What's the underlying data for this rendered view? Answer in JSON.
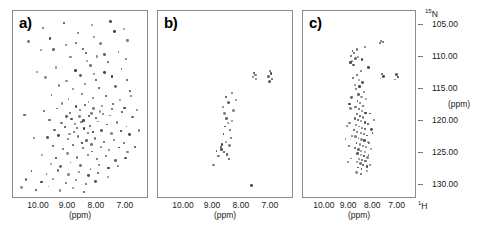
{
  "figure": {
    "panels": [
      {
        "id": "a",
        "label": "a)"
      },
      {
        "id": "b",
        "label": "b)"
      },
      {
        "id": "c",
        "label": "c)"
      }
    ],
    "x_axis": {
      "ticks": [
        "10.00",
        "9.00",
        "8.00",
        "7.00"
      ],
      "tick_values": [
        10.0,
        9.0,
        8.0,
        7.0
      ],
      "unit": "(ppm)",
      "nucleus": "1H",
      "nucleus_display": "H",
      "nucleus_superscript": "1"
    },
    "y_axis": {
      "ticks": [
        "105.00",
        "110.00",
        "115.00",
        "120.00",
        "125.00",
        "130.00"
      ],
      "tick_values": [
        105.0,
        110.0,
        115.0,
        120.0,
        125.0,
        130.0
      ],
      "unit": "(ppm)",
      "nucleus": "15N",
      "nucleus_display": "N",
      "nucleus_superscript": "15"
    },
    "colors": {
      "peak": "#3a3a3a",
      "frame": "#8c8c8c",
      "background": "#ffffff",
      "text": "#1a1a1a"
    }
  },
  "chart_data": [
    {
      "type": "scatter",
      "title": "a)",
      "xlabel": "(ppm)",
      "ylabel": "(ppm)",
      "xlim": [
        10.9,
        6.2
      ],
      "ylim": [
        103.0,
        132.0
      ],
      "grid": false,
      "legend": "none",
      "description": "2D 1H-15N HSQC spectrum, well dispersed peaks indicating a folded protein",
      "points": [
        [
          9.85,
          105.6
        ],
        [
          9.12,
          104.9
        ],
        [
          8.12,
          105.2
        ],
        [
          7.48,
          104.6
        ],
        [
          7.02,
          105.8
        ],
        [
          9.6,
          107.3
        ],
        [
          8.62,
          106.4
        ],
        [
          8.05,
          107.0
        ],
        [
          7.35,
          106.2
        ],
        [
          6.88,
          107.6
        ],
        [
          9.92,
          109.1
        ],
        [
          9.05,
          108.3
        ],
        [
          8.45,
          108.9
        ],
        [
          7.82,
          108.0
        ],
        [
          7.2,
          109.4
        ],
        [
          8.88,
          110.2
        ],
        [
          8.3,
          110.8
        ],
        [
          7.95,
          110.1
        ],
        [
          7.58,
          111.0
        ],
        [
          6.95,
          110.5
        ],
        [
          9.4,
          111.8
        ],
        [
          8.7,
          112.3
        ],
        [
          8.18,
          111.5
        ],
        [
          7.7,
          112.6
        ],
        [
          7.1,
          112.0
        ],
        [
          9.75,
          113.4
        ],
        [
          9.02,
          113.9
        ],
        [
          8.52,
          113.1
        ],
        [
          8.0,
          113.7
        ],
        [
          7.42,
          113.2
        ],
        [
          6.9,
          113.8
        ],
        [
          9.28,
          114.6
        ],
        [
          8.8,
          115.2
        ],
        [
          8.38,
          114.4
        ],
        [
          7.88,
          115.0
        ],
        [
          7.3,
          114.8
        ],
        [
          6.8,
          115.5
        ],
        [
          9.55,
          116.1
        ],
        [
          8.95,
          116.7
        ],
        [
          8.48,
          116.0
        ],
        [
          8.08,
          116.5
        ],
        [
          7.62,
          116.2
        ],
        [
          7.15,
          116.9
        ],
        [
          6.75,
          116.3
        ],
        [
          9.18,
          117.4
        ],
        [
          8.68,
          117.9
        ],
        [
          8.25,
          117.2
        ],
        [
          7.78,
          117.8
        ],
        [
          7.38,
          117.5
        ],
        [
          6.98,
          118.1
        ],
        [
          9.8,
          118.6
        ],
        [
          9.35,
          118.2
        ],
        [
          8.9,
          118.9
        ],
        [
          8.55,
          118.4
        ],
        [
          8.15,
          119.0
        ],
        [
          7.85,
          118.7
        ],
        [
          7.5,
          119.3
        ],
        [
          7.08,
          118.8
        ],
        [
          6.7,
          119.5
        ],
        [
          9.62,
          120.0
        ],
        [
          9.2,
          120.5
        ],
        [
          8.85,
          119.8
        ],
        [
          8.5,
          120.3
        ],
        [
          8.2,
          120.9
        ],
        [
          7.92,
          120.2
        ],
        [
          7.6,
          120.7
        ],
        [
          7.25,
          120.4
        ],
        [
          6.92,
          121.0
        ],
        [
          9.45,
          121.5
        ],
        [
          9.08,
          121.1
        ],
        [
          8.75,
          121.8
        ],
        [
          8.42,
          121.3
        ],
        [
          8.1,
          121.9
        ],
        [
          7.8,
          121.6
        ],
        [
          7.45,
          122.1
        ],
        [
          7.12,
          121.7
        ],
        [
          6.82,
          122.3
        ],
        [
          9.7,
          122.7
        ],
        [
          9.3,
          122.4
        ],
        [
          8.98,
          123.0
        ],
        [
          8.62,
          122.6
        ],
        [
          8.32,
          123.2
        ],
        [
          8.02,
          122.9
        ],
        [
          7.72,
          123.4
        ],
        [
          7.35,
          123.1
        ],
        [
          7.0,
          123.6
        ],
        [
          9.5,
          124.0
        ],
        [
          9.15,
          124.5
        ],
        [
          8.8,
          123.9
        ],
        [
          8.45,
          124.4
        ],
        [
          8.12,
          124.9
        ],
        [
          7.82,
          124.2
        ],
        [
          7.52,
          124.7
        ],
        [
          7.18,
          124.3
        ],
        [
          6.88,
          125.0
        ],
        [
          9.88,
          125.4
        ],
        [
          9.38,
          125.9
        ],
        [
          9.0,
          125.2
        ],
        [
          8.65,
          125.8
        ],
        [
          8.28,
          125.5
        ],
        [
          7.95,
          126.1
        ],
        [
          7.65,
          125.6
        ],
        [
          7.3,
          126.3
        ],
        [
          6.95,
          125.9
        ],
        [
          9.58,
          126.8
        ],
        [
          9.22,
          127.2
        ],
        [
          8.88,
          126.6
        ],
        [
          8.52,
          127.1
        ],
        [
          8.18,
          127.6
        ],
        [
          7.88,
          127.0
        ],
        [
          7.55,
          127.5
        ],
        [
          7.22,
          127.2
        ],
        [
          10.25,
          128.0
        ],
        [
          9.72,
          128.4
        ],
        [
          9.32,
          127.9
        ],
        [
          8.95,
          128.5
        ],
        [
          8.58,
          128.1
        ],
        [
          8.25,
          128.7
        ],
        [
          7.92,
          128.3
        ],
        [
          7.58,
          128.8
        ],
        [
          10.45,
          129.3
        ],
        [
          9.9,
          129.7
        ],
        [
          9.48,
          129.2
        ],
        [
          9.05,
          129.8
        ],
        [
          8.68,
          129.4
        ],
        [
          8.35,
          130.0
        ],
        [
          8.0,
          129.6
        ],
        [
          10.6,
          130.5
        ],
        [
          10.1,
          130.9
        ],
        [
          9.65,
          130.4
        ],
        [
          9.25,
          131.0
        ],
        [
          8.8,
          130.6
        ],
        [
          8.42,
          131.2
        ],
        [
          10.35,
          107.8
        ],
        [
          10.05,
          112.5
        ],
        [
          10.5,
          119.2
        ],
        [
          10.15,
          122.8
        ],
        [
          6.55,
          118.4
        ],
        [
          6.48,
          121.6
        ],
        [
          6.62,
          124.2
        ],
        [
          8.35,
          109.5
        ],
        [
          8.7,
          108.0
        ],
        [
          7.68,
          109.8
        ],
        [
          9.48,
          109.0
        ],
        [
          8.05,
          112.8
        ],
        [
          8.58,
          119.5
        ],
        [
          8.22,
          119.3
        ],
        [
          7.98,
          119.7
        ],
        [
          8.42,
          120.1
        ],
        [
          8.72,
          120.6
        ],
        [
          8.08,
          118.2
        ],
        [
          8.38,
          117.6
        ],
        [
          8.65,
          121.2
        ],
        [
          8.28,
          122.0
        ],
        [
          7.75,
          119.1
        ],
        [
          7.42,
          118.3
        ],
        [
          9.02,
          119.4
        ],
        [
          8.92,
          122.2
        ],
        [
          8.48,
          123.6
        ],
        [
          8.15,
          123.8
        ]
      ]
    },
    {
      "type": "scatter",
      "title": "b)",
      "xlabel": "(ppm)",
      "ylabel": "(ppm)",
      "xlim": [
        10.9,
        6.2
      ],
      "ylim": [
        103.0,
        132.0
      ],
      "grid": false,
      "legend": "none",
      "description": "2D 1H-15N HSQC spectrum, very few poorly dispersed peaks indicating an unfolded or aggregated sample",
      "points": [
        [
          7.52,
          112.6
        ],
        [
          7.48,
          113.0
        ],
        [
          7.56,
          113.3
        ],
        [
          7.45,
          113.6
        ],
        [
          6.98,
          112.4
        ],
        [
          6.94,
          112.8
        ],
        [
          7.02,
          113.2
        ],
        [
          6.9,
          113.6
        ],
        [
          6.98,
          114.0
        ],
        [
          8.3,
          115.8
        ],
        [
          8.52,
          116.4
        ],
        [
          8.42,
          117.2
        ],
        [
          8.62,
          118.0
        ],
        [
          8.58,
          119.0
        ],
        [
          8.5,
          119.8
        ],
        [
          8.45,
          120.5
        ],
        [
          8.55,
          121.0
        ],
        [
          8.38,
          121.6
        ],
        [
          8.6,
          122.2
        ],
        [
          8.35,
          122.8
        ],
        [
          8.52,
          123.4
        ],
        [
          8.65,
          123.8
        ],
        [
          8.7,
          124.2
        ],
        [
          8.68,
          124.6
        ],
        [
          8.58,
          125.0
        ],
        [
          8.48,
          125.4
        ],
        [
          8.85,
          124.8
        ],
        [
          8.78,
          125.6
        ],
        [
          8.42,
          126.0
        ],
        [
          8.95,
          127.0
        ],
        [
          7.62,
          130.2
        ],
        [
          8.18,
          116.8
        ],
        [
          8.25,
          118.5
        ],
        [
          8.32,
          120.2
        ],
        [
          8.4,
          124.0
        ]
      ]
    },
    {
      "type": "scatter",
      "title": "c)",
      "xlabel": "(ppm)",
      "ylabel": "(ppm)",
      "xlim": [
        10.9,
        6.2
      ],
      "ylim": [
        103.0,
        132.0
      ],
      "grid": false,
      "legend": "none",
      "description": "2D 1H-15N HSQC spectrum with crowded central cluster near 8.0-8.7 ppm plus sidechain pairs, indicating a partially disordered protein",
      "points": [
        [
          7.62,
          107.6
        ],
        [
          7.55,
          107.8
        ],
        [
          7.68,
          108.0
        ],
        [
          8.82,
          109.2
        ],
        [
          8.75,
          109.6
        ],
        [
          8.88,
          110.0
        ],
        [
          8.7,
          110.4
        ],
        [
          8.85,
          110.8
        ],
        [
          8.65,
          109.0
        ],
        [
          8.92,
          111.0
        ],
        [
          8.58,
          110.2
        ],
        [
          8.78,
          111.4
        ],
        [
          8.3,
          108.6
        ],
        [
          8.42,
          110.6
        ],
        [
          8.15,
          111.8
        ],
        [
          7.58,
          112.8
        ],
        [
          7.52,
          113.2
        ],
        [
          7.64,
          113.5
        ],
        [
          6.98,
          112.9
        ],
        [
          6.92,
          113.3
        ],
        [
          7.04,
          113.7
        ],
        [
          8.48,
          112.4
        ],
        [
          8.62,
          113.0
        ],
        [
          8.55,
          113.8
        ],
        [
          8.4,
          114.2
        ],
        [
          8.52,
          114.8
        ],
        [
          8.68,
          115.2
        ],
        [
          8.35,
          115.6
        ],
        [
          8.58,
          116.0
        ],
        [
          8.45,
          116.4
        ],
        [
          8.25,
          116.8
        ],
        [
          8.62,
          117.0
        ],
        [
          8.5,
          117.4
        ],
        [
          8.38,
          117.8
        ],
        [
          8.7,
          118.0
        ],
        [
          8.55,
          118.3
        ],
        [
          8.42,
          118.6
        ],
        [
          8.28,
          118.9
        ],
        [
          8.65,
          119.1
        ],
        [
          8.52,
          119.4
        ],
        [
          8.38,
          119.6
        ],
        [
          8.72,
          119.8
        ],
        [
          8.6,
          120.0
        ],
        [
          8.45,
          120.2
        ],
        [
          8.3,
          120.4
        ],
        [
          8.18,
          120.6
        ],
        [
          8.68,
          120.8
        ],
        [
          8.55,
          121.0
        ],
        [
          8.42,
          121.2
        ],
        [
          8.28,
          121.4
        ],
        [
          8.75,
          121.6
        ],
        [
          8.62,
          121.8
        ],
        [
          8.48,
          122.0
        ],
        [
          8.35,
          122.2
        ],
        [
          8.22,
          122.4
        ],
        [
          8.7,
          122.6
        ],
        [
          8.58,
          122.8
        ],
        [
          8.45,
          123.0
        ],
        [
          8.32,
          123.2
        ],
        [
          8.18,
          123.4
        ],
        [
          8.65,
          123.6
        ],
        [
          8.52,
          123.8
        ],
        [
          8.38,
          124.0
        ],
        [
          8.25,
          124.2
        ],
        [
          8.72,
          124.4
        ],
        [
          8.58,
          124.6
        ],
        [
          8.45,
          124.8
        ],
        [
          8.3,
          125.0
        ],
        [
          8.62,
          125.2
        ],
        [
          8.48,
          125.4
        ],
        [
          8.35,
          125.6
        ],
        [
          8.2,
          125.8
        ],
        [
          8.55,
          126.0
        ],
        [
          8.42,
          126.2
        ],
        [
          8.28,
          126.4
        ],
        [
          8.65,
          126.6
        ],
        [
          8.5,
          126.8
        ],
        [
          8.38,
          127.0
        ],
        [
          8.22,
          127.2
        ],
        [
          8.58,
          127.4
        ],
        [
          8.45,
          127.6
        ],
        [
          8.9,
          118.2
        ],
        [
          8.95,
          120.5
        ],
        [
          8.85,
          122.5
        ],
        [
          8.98,
          124.0
        ],
        [
          9.05,
          121.0
        ],
        [
          9.12,
          123.0
        ],
        [
          8.88,
          126.0
        ],
        [
          9.0,
          126.5
        ],
        [
          8.08,
          119.0
        ],
        [
          8.02,
          121.5
        ],
        [
          8.12,
          123.5
        ],
        [
          7.98,
          122.0
        ],
        [
          8.05,
          124.5
        ],
        [
          7.92,
          120.0
        ],
        [
          8.15,
          125.5
        ],
        [
          8.08,
          127.0
        ],
        [
          8.8,
          113.5
        ],
        [
          8.72,
          114.5
        ],
        [
          8.88,
          116.5
        ],
        [
          8.95,
          117.5
        ],
        [
          8.22,
          128.0
        ],
        [
          8.48,
          128.4
        ],
        [
          8.65,
          128.2
        ]
      ]
    }
  ]
}
